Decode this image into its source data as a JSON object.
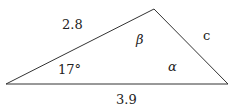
{
  "diagram": {
    "type": "triangle",
    "vertices": {
      "left": [
        6,
        84
      ],
      "top": [
        154,
        9
      ],
      "right": [
        228,
        84
      ]
    },
    "stroke_color": "#333333",
    "labels": {
      "side_left_top": "2.8",
      "side_top_right": "c",
      "side_bottom": "3.9",
      "angle_left": "17°",
      "angle_top": "β",
      "angle_right": "α"
    }
  }
}
